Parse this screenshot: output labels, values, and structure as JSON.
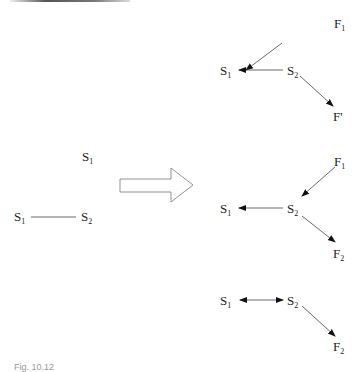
{
  "left": {
    "top_node": {
      "base": "S",
      "sub": "1"
    },
    "pair": [
      {
        "base": "S",
        "sub": "1"
      },
      {
        "base": "S",
        "sub": "2"
      }
    ]
  },
  "transform_arrow": "hollow-right-arrow",
  "right": {
    "row1": {
      "s1": {
        "base": "S",
        "sub": "1"
      },
      "s2": {
        "base": "S",
        "sub": "2"
      },
      "f_in": {
        "base": "F",
        "sub": "1"
      },
      "f_out": {
        "base": "F",
        "sub": "'"
      }
    },
    "row2": {
      "s1": {
        "base": "S",
        "sub": "1"
      },
      "s2": {
        "base": "S",
        "sub": "2"
      },
      "f_in": {
        "base": "F",
        "sub": "1"
      },
      "f_out": {
        "base": "F",
        "sub": "2"
      }
    },
    "row3": {
      "s1": {
        "base": "S",
        "sub": "1"
      },
      "s2": {
        "base": "S",
        "sub": "2"
      },
      "f_out": {
        "base": "F",
        "sub": "2"
      }
    }
  },
  "caption": "Fig. 10.12"
}
